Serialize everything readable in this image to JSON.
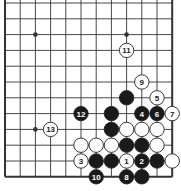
{
  "diagram": {
    "type": "go-problem",
    "grid": {
      "cols": 12,
      "rows": 12,
      "x0": 5,
      "y0": 3,
      "dx": 15.2,
      "dy": 15.8,
      "edges": {
        "left": true,
        "right": true,
        "bottom": true,
        "top": false
      }
    },
    "colors": {
      "line": "#333333",
      "black_stone": "#1a1a1a",
      "white_stone": "#ffffff",
      "stone_outline": "#222222"
    },
    "star_points": [
      [
        2,
        2
      ],
      [
        8,
        2
      ],
      [
        2,
        8
      ]
    ],
    "stones": [
      {
        "col": 8,
        "row": 3,
        "color": "white",
        "label": "11"
      },
      {
        "col": 9,
        "row": 5,
        "color": "white",
        "label": "9"
      },
      {
        "col": 8,
        "row": 6,
        "color": "black",
        "label": ""
      },
      {
        "col": 10,
        "row": 6,
        "color": "white",
        "label": "5"
      },
      {
        "col": 5,
        "row": 7,
        "color": "black",
        "label": "12"
      },
      {
        "col": 7,
        "row": 7,
        "color": "black",
        "label": ""
      },
      {
        "col": 9,
        "row": 7,
        "color": "black",
        "label": "4"
      },
      {
        "col": 10,
        "row": 7,
        "color": "black",
        "label": "6"
      },
      {
        "col": 11,
        "row": 7,
        "color": "white",
        "label": "7"
      },
      {
        "col": 3,
        "row": 8,
        "color": "white",
        "label": "13"
      },
      {
        "col": 7,
        "row": 8,
        "color": "black",
        "label": ""
      },
      {
        "col": 8,
        "row": 8,
        "color": "white",
        "label": ""
      },
      {
        "col": 9,
        "row": 8,
        "color": "white",
        "label": ""
      },
      {
        "col": 10,
        "row": 8,
        "color": "white",
        "label": ""
      },
      {
        "col": 5,
        "row": 9,
        "color": "white",
        "label": ""
      },
      {
        "col": 6,
        "row": 9,
        "color": "white",
        "label": ""
      },
      {
        "col": 7,
        "row": 9,
        "color": "white",
        "label": ""
      },
      {
        "col": 8,
        "row": 9,
        "color": "black",
        "label": ""
      },
      {
        "col": 9,
        "row": 9,
        "color": "black",
        "label": ""
      },
      {
        "col": 10,
        "row": 9,
        "color": "white",
        "label": ""
      },
      {
        "col": 5,
        "row": 10,
        "color": "white",
        "label": "3"
      },
      {
        "col": 6,
        "row": 10,
        "color": "black",
        "label": ""
      },
      {
        "col": 7,
        "row": 10,
        "color": "black",
        "label": ""
      },
      {
        "col": 8,
        "row": 10,
        "color": "white",
        "label": "1"
      },
      {
        "col": 9,
        "row": 10,
        "color": "black",
        "label": "2"
      },
      {
        "col": 10,
        "row": 10,
        "color": "black",
        "label": ""
      },
      {
        "col": 11,
        "row": 10,
        "color": "white",
        "label": ""
      },
      {
        "col": 6,
        "row": 11,
        "color": "black",
        "label": "10"
      },
      {
        "col": 8,
        "row": 11,
        "color": "black",
        "label": "8"
      },
      {
        "col": 9,
        "row": 11,
        "color": "black",
        "label": ""
      }
    ]
  }
}
